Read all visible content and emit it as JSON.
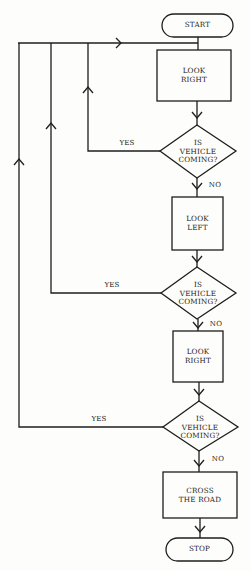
{
  "diagram": {
    "type": "flowchart",
    "nodes": [
      {
        "id": "start",
        "shape": "terminator",
        "label": "START"
      },
      {
        "id": "look_right_1",
        "shape": "process",
        "label": "LOOK\nRIGHT"
      },
      {
        "id": "decision_1",
        "shape": "decision",
        "label": "IS\nVEHICLE\nCOMING?"
      },
      {
        "id": "look_left",
        "shape": "process",
        "label": "LOOK\nLEFT"
      },
      {
        "id": "decision_2",
        "shape": "decision",
        "label": "IS\nVEHICLE\nCOMING?"
      },
      {
        "id": "look_right_2",
        "shape": "process",
        "label": "LOOK\nRIGHT"
      },
      {
        "id": "decision_3",
        "shape": "decision",
        "label": "IS\nVEHICLE\nCOMING?"
      },
      {
        "id": "cross",
        "shape": "process",
        "label": "CROSS\nTHE ROAD"
      },
      {
        "id": "stop",
        "shape": "terminator",
        "label": "STOP"
      }
    ],
    "edges": [
      {
        "from": "start",
        "to": "look_right_1",
        "label": ""
      },
      {
        "from": "look_right_1",
        "to": "decision_1",
        "label": ""
      },
      {
        "from": "decision_1",
        "to": "look_right_1",
        "label": "YES"
      },
      {
        "from": "decision_1",
        "to": "look_left",
        "label": "NO"
      },
      {
        "from": "look_left",
        "to": "decision_2",
        "label": ""
      },
      {
        "from": "decision_2",
        "to": "look_right_1",
        "label": "YES"
      },
      {
        "from": "decision_2",
        "to": "look_right_2",
        "label": "NO"
      },
      {
        "from": "look_right_2",
        "to": "decision_3",
        "label": ""
      },
      {
        "from": "decision_3",
        "to": "look_right_1",
        "label": "YES"
      },
      {
        "from": "decision_3",
        "to": "cross",
        "label": "NO"
      },
      {
        "from": "cross",
        "to": "stop",
        "label": ""
      }
    ],
    "edge_labels": {
      "yes": "YES",
      "no": "NO"
    }
  }
}
